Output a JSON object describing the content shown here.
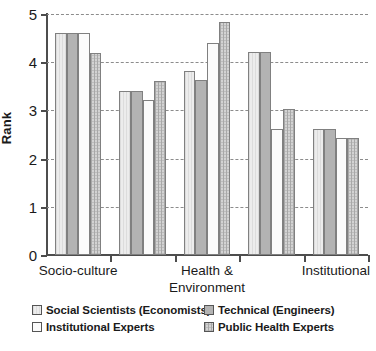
{
  "chart_data": {
    "type": "bar",
    "title": "",
    "xlabel": "",
    "ylabel": "Rank",
    "ylim": [
      0,
      5
    ],
    "yticks": [
      0,
      1,
      2,
      3,
      4,
      5
    ],
    "ytick_labels": [
      "0",
      "1",
      "2",
      "3",
      "4",
      "5"
    ],
    "grid": true,
    "grid_axis": "y",
    "grid_style": "dashed",
    "legend_position": "below",
    "categories": [
      "Socio-culture",
      "",
      "Health & Environment",
      "",
      "Institutional"
    ],
    "category_labels_shown": [
      "Socio-culture",
      "Health & Environment",
      "Institutional"
    ],
    "series": [
      {
        "name": "Social Scientists (Economists)",
        "fill": "light-vertical-hatch",
        "color": "#ececec",
        "values": [
          4.6,
          3.4,
          3.82,
          4.22,
          2.62
        ]
      },
      {
        "name": "Technical (Engineers)",
        "fill": "solid-grey",
        "color": "#b3b3b3",
        "values": [
          4.6,
          3.4,
          3.64,
          4.22,
          2.62
        ]
      },
      {
        "name": "Institutional Experts",
        "fill": "white",
        "color": "#fbfbfb",
        "values": [
          4.6,
          3.22,
          4.4,
          2.62,
          2.42
        ]
      },
      {
        "name": "Public Health Experts",
        "fill": "grey-dotted",
        "color": "#d3d3d3",
        "values": [
          4.2,
          3.62,
          4.84,
          3.02,
          2.42
        ]
      }
    ]
  },
  "legend": {
    "items": [
      {
        "label": "Social Scientists (Economists)",
        "swatch": "light-vertical-hatch"
      },
      {
        "label": "Technical (Engineers)",
        "swatch": "solid-grey"
      },
      {
        "label": "Institutional Experts",
        "swatch": "white"
      },
      {
        "label": "Public Health Experts",
        "swatch": "grey-dotted"
      }
    ]
  },
  "axes": {
    "y_title": "Rank"
  }
}
